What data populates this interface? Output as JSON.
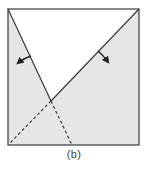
{
  "figure": {
    "caption": "(b)",
    "colors": {
      "square_fill": "#e6e6e6",
      "unfolded_region": "#ffffff",
      "stroke": "#3a3a3a",
      "arrow": "#222222"
    },
    "square": {
      "x1": 8,
      "y1": 9,
      "x2": 139,
      "y2": 145
    },
    "intersection": {
      "x": 51,
      "y": 101
    },
    "fold_lines": [
      {
        "name": "left-fold-line",
        "style": "solid",
        "from": [
          8,
          9
        ],
        "to": [
          51,
          101
        ]
      },
      {
        "name": "right-fold-line",
        "style": "solid",
        "from": [
          139,
          9
        ],
        "to": [
          51,
          101
        ]
      },
      {
        "name": "left-dashed-extension",
        "style": "dashed",
        "from": [
          51,
          101
        ],
        "to": [
          9,
          144
        ]
      },
      {
        "name": "right-dashed-extension",
        "style": "dashed",
        "from": [
          51,
          101
        ],
        "to": [
          72,
          145
        ]
      }
    ],
    "arrows": [
      {
        "name": "left-fold-arrow",
        "direction": "down-left"
      },
      {
        "name": "right-fold-arrow",
        "direction": "down-right"
      }
    ]
  }
}
